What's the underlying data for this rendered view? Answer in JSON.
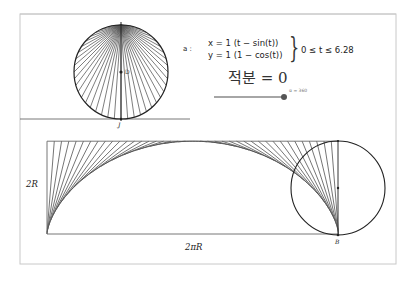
{
  "canvas": {
    "frame": {
      "x": 20,
      "y": 14,
      "w": 376,
      "h": 250,
      "color": "#c8c8c8"
    },
    "separator_line": {
      "x1": 20,
      "x2": 190,
      "y": 119,
      "color": "#555555"
    }
  },
  "top_circle": {
    "cx": 121,
    "cy": 72,
    "r": 47,
    "center_label": "D",
    "bottom_label": "J",
    "spoke_count": 44,
    "spoke_color": "#555555",
    "outline_color": "#222222"
  },
  "parametric": {
    "name_label": "a :",
    "x_equation": "x = 1 (t − sin(t))",
    "y_equation": "y = 1 (1 − cos(t))",
    "brace": "}",
    "range": "0 ≤ t ≤ 6.28"
  },
  "integral_text": "적분 = 0",
  "slider": {
    "label": "α = 360",
    "value": 360,
    "x1": 214,
    "x2": 284,
    "y": 97,
    "track_color": "#888888",
    "knob_color": "#555555"
  },
  "cycloid": {
    "origin_x": 47,
    "base_y": 234,
    "R": 46.4,
    "tangent_count": 40,
    "line_color": "#666666",
    "rect_color": "#777777",
    "labels": {
      "height": "2R",
      "width": "2πR",
      "end_point": "B"
    }
  },
  "rolling_circle": {
    "cx": 338,
    "cy": 188,
    "r": 47,
    "color": "#222222"
  }
}
